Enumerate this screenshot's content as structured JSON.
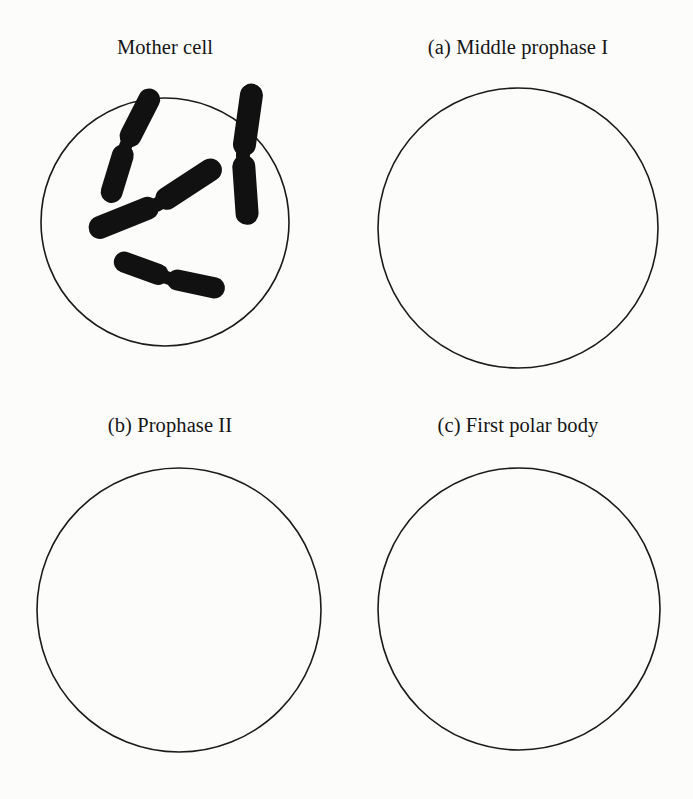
{
  "figure": {
    "kind": "meiosis-worksheet-diagram",
    "background_color": "#fcfcfb",
    "ink_color": "#111111",
    "outline_color": "#1b1b1b",
    "panel_count": 4,
    "filled_panel_count": 1,
    "blank_panel_count": 3
  },
  "panels": [
    {
      "id": "mother-cell",
      "label": "Mother cell",
      "marker": "",
      "title": "Mother cell",
      "state": "filled",
      "chromosome_count": 4,
      "circle": {
        "cx": 165,
        "cy": 186,
        "r": 124
      }
    },
    {
      "id": "middle-prophase-i",
      "label": "(a) Middle prophase I",
      "marker": "(a)",
      "title": "Middle prophase I",
      "state": "blank",
      "chromosome_count": 0,
      "circle": {
        "cx": 170,
        "cy": 192,
        "r": 140
      }
    },
    {
      "id": "prophase-ii",
      "label": "(b) Prophase II",
      "marker": "(b)",
      "title": "Prophase II",
      "state": "blank",
      "chromosome_count": 0,
      "circle": {
        "cx": 179,
        "cy": 196,
        "r": 142
      }
    },
    {
      "id": "first-polar-body",
      "label": "(c) First polar body",
      "marker": "(c)",
      "title": "First polar body",
      "state": "blank",
      "chromosome_count": 0,
      "circle": {
        "cx": 171,
        "cy": 195,
        "r": 141
      }
    }
  ],
  "chromosomes": [
    {
      "id": "chromosome-upper-left",
      "position": "upper left",
      "angle_deg": 27,
      "length": 118,
      "arm_thickness": 22,
      "centromere": {
        "x": 126,
        "y": 109
      }
    },
    {
      "id": "chromosome-right",
      "position": "right",
      "angle_deg": 8,
      "length": 136,
      "arm_thickness": 23,
      "centromere": {
        "x": 243,
        "y": 119
      }
    },
    {
      "id": "chromosome-center-diagonal",
      "position": "center",
      "angle_deg": -33,
      "length": 140,
      "arm_thickness": 23,
      "centromere": {
        "x": 158,
        "y": 168
      }
    },
    {
      "id": "chromosome-bottom",
      "position": "bottom",
      "angle_deg": 102,
      "length": 112,
      "arm_thickness": 21,
      "centromere": {
        "x": 168,
        "y": 242
      }
    }
  ]
}
